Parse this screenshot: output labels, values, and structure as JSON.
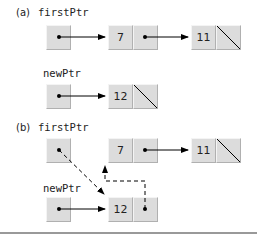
{
  "part_a": {
    "label": "(a)",
    "first_ptr_label": "firstPtr",
    "new_ptr_label": "newPtr",
    "nodes": [
      {
        "value": "7"
      },
      {
        "value": "11"
      },
      {
        "value": "12"
      }
    ]
  },
  "part_b": {
    "label": "(b)",
    "first_ptr_label": "firstPtr",
    "new_ptr_label": "newPtr",
    "nodes": [
      {
        "value": "7"
      },
      {
        "value": "11"
      },
      {
        "value": "12"
      }
    ]
  },
  "colors": {
    "cell": "#dcdcdc",
    "line": "#000000",
    "rule": "#999999"
  }
}
